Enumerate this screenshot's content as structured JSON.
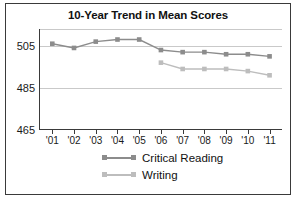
{
  "chart_data": {
    "type": "line",
    "title": "10-Year Trend in Mean Scores",
    "xlabel": "",
    "ylabel": "",
    "categories": [
      "'01",
      "'02",
      "'03",
      "'04",
      "'05",
      "'06",
      "'07",
      "'08",
      "'09",
      "'10",
      "'11"
    ],
    "ylim": [
      465,
      513
    ],
    "yticks": [
      465,
      485,
      505
    ],
    "ytick_labels": [
      "465",
      "485",
      "505"
    ],
    "grid": true,
    "legend_position": "bottom",
    "series": [
      {
        "name": "Critical Reading",
        "color": "#8c8c8c",
        "x": [
          "'01",
          "'02",
          "'03",
          "'04",
          "'05",
          "'06",
          "'07",
          "'08",
          "'09",
          "'10",
          "'11"
        ],
        "values": [
          506,
          504,
          507,
          508,
          508,
          503,
          502,
          502,
          501,
          501,
          500
        ]
      },
      {
        "name": "Writing",
        "color": "#bdbdbd",
        "x": [
          "'06",
          "'07",
          "'08",
          "'09",
          "'10",
          "'11"
        ],
        "values": [
          497,
          494,
          494,
          494,
          493,
          491
        ]
      }
    ]
  },
  "figure": {
    "border_color": "#3a3a3a",
    "background": "#ffffff",
    "axis_color": "#3a3a3a",
    "gridline_color": "#c9c9c9"
  },
  "legend": {
    "items": [
      {
        "label": "Critical Reading",
        "color": "#8c8c8c"
      },
      {
        "label": "Writing",
        "color": "#bdbdbd"
      }
    ]
  }
}
